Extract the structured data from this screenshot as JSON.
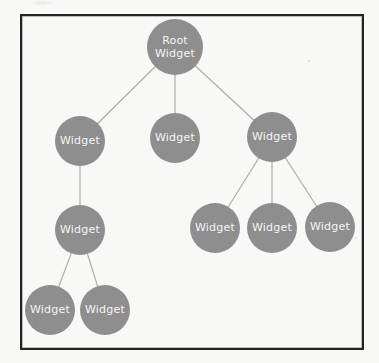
{
  "diagram": {
    "type": "tree",
    "colors": {
      "node_fill": "#8e8e8e",
      "node_text": "#f5f5f3",
      "edge": "#aeaca6",
      "frame_border": "#242424",
      "paper": "#f8f8f6"
    },
    "nodes": [
      {
        "id": "root",
        "label": "Root Widget",
        "x": 175,
        "y": 47,
        "r": 28
      },
      {
        "id": "w1",
        "label": "Widget",
        "x": 80,
        "y": 141,
        "r": 25
      },
      {
        "id": "w2",
        "label": "Widget",
        "x": 175,
        "y": 138,
        "r": 25
      },
      {
        "id": "w3",
        "label": "Widget",
        "x": 272,
        "y": 137,
        "r": 25
      },
      {
        "id": "w4",
        "label": "Widget",
        "x": 80,
        "y": 230,
        "r": 25
      },
      {
        "id": "w5",
        "label": "Widget",
        "x": 215,
        "y": 228,
        "r": 25
      },
      {
        "id": "w6",
        "label": "Widget",
        "x": 272,
        "y": 228,
        "r": 25
      },
      {
        "id": "w7",
        "label": "Widget",
        "x": 330,
        "y": 227,
        "r": 25
      },
      {
        "id": "w8",
        "label": "Widget",
        "x": 50,
        "y": 310,
        "r": 25
      },
      {
        "id": "w9",
        "label": "Widget",
        "x": 105,
        "y": 310,
        "r": 25
      }
    ],
    "edges": [
      [
        "root",
        "w1"
      ],
      [
        "root",
        "w2"
      ],
      [
        "root",
        "w3"
      ],
      [
        "w1",
        "w4"
      ],
      [
        "w3",
        "w5"
      ],
      [
        "w3",
        "w6"
      ],
      [
        "w3",
        "w7"
      ],
      [
        "w4",
        "w8"
      ],
      [
        "w4",
        "w9"
      ]
    ]
  }
}
